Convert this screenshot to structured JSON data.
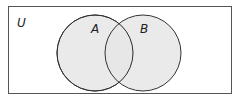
{
  "diagram": {
    "type": "venn",
    "universe_label": "U",
    "sets": [
      {
        "label": "A"
      },
      {
        "label": "B"
      }
    ],
    "colors": {
      "fill": "#e6e6e6",
      "stroke": "#333333",
      "background": "#ffffff"
    }
  }
}
